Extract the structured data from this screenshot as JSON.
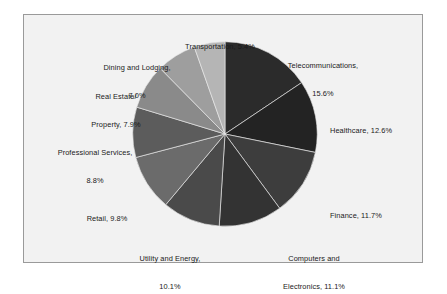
{
  "figure": {
    "background_color": "#ffffff",
    "plot_background_color": "#f2f2f2",
    "plot_border_color": "#9a9a9a"
  },
  "chart_data": {
    "type": "pie",
    "title": "",
    "subtitle": "",
    "xlabel": "",
    "ylabel": "",
    "grid": false,
    "legend_position": "none",
    "label_format": "{name}, {value}%",
    "start_angle_deg": 0,
    "direction": "clockwise",
    "units": "percent",
    "total": 100.0,
    "categories": [
      "Telecommunications",
      "Healthcare",
      "Finance",
      "Computers and Electronics",
      "Utility and Energy",
      "Retail",
      "Professional Services",
      "Real Estate/Property",
      "Dining and Lodging",
      "Transportation"
    ],
    "values": [
      15.6,
      12.6,
      11.7,
      11.1,
      10.1,
      9.8,
      8.8,
      7.9,
      7.0,
      5.4
    ],
    "colors": [
      "#2b2b2b",
      "#232323",
      "#3d3d3d",
      "#333333",
      "#4a4a4a",
      "#6b6b6b",
      "#5c5c5c",
      "#8a8a8a",
      "#9e9e9e",
      "#b5b5b5"
    ],
    "slices": [
      {
        "name": "Telecommunications",
        "value": 15.6,
        "color": "#2b2b2b",
        "label_line1": "Telecommunications,",
        "label_line2": "15.6%"
      },
      {
        "name": "Healthcare",
        "value": 12.6,
        "color": "#232323",
        "label_line1": "Healthcare, 12.6%",
        "label_line2": ""
      },
      {
        "name": "Finance",
        "value": 11.7,
        "color": "#3d3d3d",
        "label_line1": "Finance, 11.7%",
        "label_line2": ""
      },
      {
        "name": "Computers and Electronics",
        "value": 11.1,
        "color": "#333333",
        "label_line1": "Computers and",
        "label_line2": "Electronics, 11.1%"
      },
      {
        "name": "Utility and Energy",
        "value": 10.1,
        "color": "#4a4a4a",
        "label_line1": "Utility and Energy,",
        "label_line2": "10.1%"
      },
      {
        "name": "Retail",
        "value": 9.8,
        "color": "#6b6b6b",
        "label_line1": "Retail, 9.8%",
        "label_line2": ""
      },
      {
        "name": "Professional Services",
        "value": 8.8,
        "color": "#5c5c5c",
        "label_line1": "Professional Services,",
        "label_line2": "8.8%"
      },
      {
        "name": "Real Estate/Property",
        "value": 7.9,
        "color": "#8a8a8a",
        "label_line1": "Real Estate/",
        "label_line2": "Property, 7.9%"
      },
      {
        "name": "Dining and Lodging",
        "value": 7.0,
        "color": "#9e9e9e",
        "label_line1": "Dining and Lodging,",
        "label_line2": "7.0%"
      },
      {
        "name": "Transportation",
        "value": 5.4,
        "color": "#b5b5b5",
        "label_line1": "Transportation, 5.4%",
        "label_line2": ""
      }
    ]
  },
  "labels": {
    "telecommunications": {
      "line1": "Telecommunications,",
      "line2": "15.6%"
    },
    "healthcare": {
      "line1": "Healthcare, 12.6%",
      "line2": ""
    },
    "finance": {
      "line1": "Finance, 11.7%",
      "line2": ""
    },
    "computers": {
      "line1": "Computers and",
      "line2": "Electronics, 11.1%"
    },
    "utility": {
      "line1": "Utility and Energy,",
      "line2": "10.1%"
    },
    "retail": {
      "line1": "Retail, 9.8%",
      "line2": ""
    },
    "professional": {
      "line1": "Professional Services,",
      "line2": "8.8%"
    },
    "realestate": {
      "line1": "Real Estate/",
      "line2": "Property, 7.9%"
    },
    "dining": {
      "line1": "Dining and Lodging,",
      "line2": "7.0%"
    },
    "transportation": {
      "line1": "Transportation, 5.4%",
      "line2": ""
    }
  }
}
